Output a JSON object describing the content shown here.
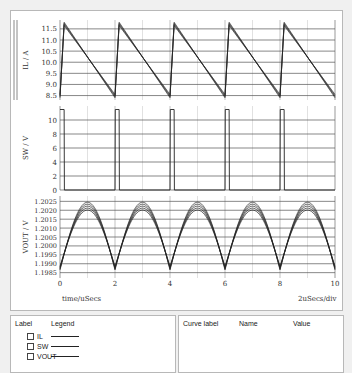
{
  "chart_data": [
    {
      "type": "line",
      "ylabel": "IL / A",
      "yticks": [
        8.5,
        9.0,
        9.5,
        10.0,
        10.5,
        11.0,
        11.5
      ],
      "ylim": [
        8.3,
        11.9
      ],
      "description": "Sawtooth inductor current, rises sharply at t=0,2,4,6,8 us to ~11.8 A, falls linearly to ~8.4 A",
      "x": [
        0,
        0.15,
        2.0,
        2.15,
        4.0,
        4.15,
        6.0,
        6.15,
        8.0,
        8.15,
        10.0
      ],
      "values": [
        8.4,
        11.8,
        8.4,
        11.8,
        8.4,
        11.8,
        8.4,
        11.8,
        8.4,
        11.8,
        8.4
      ]
    },
    {
      "type": "line",
      "ylabel": "SW / V",
      "yticks": [
        0,
        2,
        4,
        6,
        8,
        10
      ],
      "ylim": [
        0,
        12
      ],
      "description": "Switch node pulses ~11.5 V, width ~0.15 us at t=0,2,4,6,8 us",
      "x": [
        0,
        0.15,
        0.16,
        2.0,
        2.01,
        2.15,
        2.16,
        4.0,
        4.01,
        4.15,
        4.16,
        6.0,
        6.01,
        6.15,
        6.16,
        8.0,
        8.01,
        8.15,
        8.16,
        10.0
      ],
      "values": [
        11.5,
        11.5,
        0,
        0,
        11.5,
        11.5,
        0,
        0,
        11.5,
        11.5,
        0,
        0,
        11.5,
        11.5,
        0,
        0,
        11.5,
        11.5,
        0,
        0
      ]
    },
    {
      "type": "line",
      "ylabel": "VOUT / V",
      "yticks": [
        1.1985,
        1.199,
        1.1995,
        1.2,
        1.2005,
        1.201,
        1.2015,
        1.202,
        1.2025
      ],
      "ylim": [
        1.1982,
        1.2028
      ],
      "description": "Output voltage ripple, peaks ~1.2025 V at t=1,3,5,7,9 us, minima ~1.1985 V at t=0,2,4,6,8,10 us (multiple overlaid curves)",
      "x": [
        0,
        1,
        2,
        3,
        4,
        5,
        6,
        7,
        8,
        9,
        10
      ],
      "values": [
        1.1985,
        1.2025,
        1.1985,
        1.2025,
        1.1985,
        1.2025,
        1.1985,
        1.2025,
        1.1985,
        1.2025,
        1.1985
      ]
    }
  ],
  "xaxis": {
    "label": "time/uSecs",
    "ticks": [
      "0",
      "2",
      "4",
      "6",
      "8",
      "10"
    ],
    "scale": "2uSecs/div"
  },
  "plots": {
    "il": {
      "label": "IL / A",
      "ticks": [
        "11.5",
        "11.0",
        "10.5",
        "10.0",
        "9.5",
        "9.0",
        "8.5"
      ]
    },
    "sw": {
      "label": "SW / V",
      "ticks": [
        "10",
        "8",
        "6",
        "4",
        "2",
        "0"
      ]
    },
    "vout": {
      "label": "VOUT / V",
      "ticks": [
        "1.2025",
        "1.2020",
        "1.2015",
        "1.2010",
        "1.2005",
        "1.2000",
        "1.1995",
        "1.1990",
        "1.1985"
      ]
    }
  },
  "legend_panel": {
    "col_label": "Label",
    "col_legend": "Legend",
    "items": [
      {
        "name": "IL"
      },
      {
        "name": "SW"
      },
      {
        "name": "VOUT"
      }
    ]
  },
  "cursor_panel": {
    "col_curve": "Curve label",
    "col_name": "Name",
    "col_value": "Value"
  },
  "colors": {
    "trace": "#222222",
    "grid": "#555555",
    "vgrid": "#cccccc"
  }
}
